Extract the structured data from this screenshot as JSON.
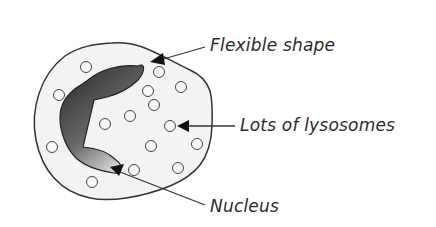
{
  "diagram": {
    "labels": {
      "flexible_shape": "Flexible shape",
      "lysosomes": "Lots of lysosomes",
      "nucleus": "Nucleus"
    },
    "colors": {
      "cell_fill": "#f3f3f3",
      "outline": "#333333",
      "nucleus_dark": "#3a3a3a",
      "nucleus_light": "#f0f0f0",
      "text": "#2a2a2a"
    }
  }
}
